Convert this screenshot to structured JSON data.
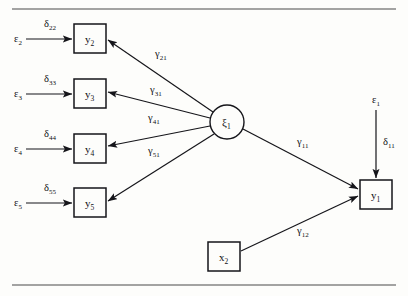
{
  "figure": {
    "type": "path-diagram",
    "rules": {
      "top_y": 9,
      "bottom_y": 285
    }
  },
  "nodes": {
    "latent": [
      {
        "id": "xi1",
        "shape": "circle",
        "symbol": "ξ",
        "subscript": "1",
        "cx": 227,
        "cy": 122,
        "r": 17
      }
    ],
    "observed": [
      {
        "id": "y2",
        "shape": "box",
        "symbol": "y",
        "subscript": "2",
        "x": 74,
        "y": 24,
        "w": 32,
        "h": 29
      },
      {
        "id": "y3",
        "shape": "box",
        "symbol": "y",
        "subscript": "3",
        "x": 74,
        "y": 79,
        "w": 32,
        "h": 29
      },
      {
        "id": "y4",
        "shape": "box",
        "symbol": "y",
        "subscript": "4",
        "x": 74,
        "y": 134,
        "w": 32,
        "h": 29
      },
      {
        "id": "y5",
        "shape": "box",
        "symbol": "y",
        "subscript": "5",
        "x": 74,
        "y": 188,
        "w": 32,
        "h": 29
      },
      {
        "id": "y1",
        "shape": "box",
        "symbol": "y",
        "subscript": "1",
        "x": 360,
        "y": 180,
        "w": 32,
        "h": 29
      },
      {
        "id": "x2",
        "shape": "box",
        "symbol": "x",
        "subscript": "2",
        "x": 208,
        "y": 242,
        "w": 32,
        "h": 29
      }
    ],
    "errors": [
      {
        "id": "e2",
        "symbol": "ε",
        "subscript": "2",
        "x": 14,
        "y": 42
      },
      {
        "id": "e3",
        "symbol": "ε",
        "subscript": "3",
        "x": 14,
        "y": 97
      },
      {
        "id": "e4",
        "symbol": "ε",
        "subscript": "4",
        "x": 14,
        "y": 152
      },
      {
        "id": "e5",
        "symbol": "ε",
        "subscript": "5",
        "x": 14,
        "y": 206
      },
      {
        "id": "e1",
        "symbol": "ε",
        "subscript": "1",
        "x": 372,
        "y": 103
      }
    ]
  },
  "edges": [
    {
      "id": "d22",
      "from": "e2",
      "to": "y2",
      "symbol": "δ",
      "subscript": "22",
      "label_x": 44,
      "label_y": 27,
      "x1": 26,
      "y1": 39,
      "x2": 72,
      "y2": 39
    },
    {
      "id": "d33",
      "from": "e3",
      "to": "y3",
      "symbol": "δ",
      "subscript": "33",
      "label_x": 44,
      "label_y": 82,
      "x1": 26,
      "y1": 94,
      "x2": 72,
      "y2": 94
    },
    {
      "id": "d44",
      "from": "e4",
      "to": "y4",
      "symbol": "δ",
      "subscript": "44",
      "label_x": 44,
      "label_y": 137,
      "x1": 26,
      "y1": 149,
      "x2": 72,
      "y2": 149
    },
    {
      "id": "d55",
      "from": "e5",
      "to": "y5",
      "symbol": "δ",
      "subscript": "55",
      "label_x": 44,
      "label_y": 191,
      "x1": 26,
      "y1": 203,
      "x2": 72,
      "y2": 203
    },
    {
      "id": "d11",
      "from": "e1",
      "to": "y1",
      "symbol": "δ",
      "subscript": "11",
      "label_x": 383,
      "label_y": 145,
      "x1": 376,
      "y1": 110,
      "x2": 376,
      "y2": 178
    },
    {
      "id": "g21",
      "from": "xi1",
      "to": "y2",
      "symbol": "γ",
      "subscript": "21",
      "label_x": 155,
      "label_y": 57,
      "x1": 213,
      "y1": 112,
      "x2": 108,
      "y2": 40
    },
    {
      "id": "g31",
      "from": "xi1",
      "to": "y3",
      "symbol": "γ",
      "subscript": "31",
      "label_x": 150,
      "label_y": 93,
      "x1": 210,
      "y1": 118,
      "x2": 108,
      "y2": 92
    },
    {
      "id": "g41",
      "from": "xi1",
      "to": "y4",
      "symbol": "γ",
      "subscript": "41",
      "label_x": 148,
      "label_y": 121,
      "x1": 210,
      "y1": 126,
      "x2": 108,
      "y2": 146
    },
    {
      "id": "g51",
      "from": "xi1",
      "to": "y5",
      "symbol": "γ",
      "subscript": "51",
      "label_x": 148,
      "label_y": 154,
      "x1": 214,
      "y1": 134,
      "x2": 108,
      "y2": 201
    },
    {
      "id": "g11",
      "from": "xi1",
      "to": "y1",
      "symbol": "γ",
      "subscript": "11",
      "label_x": 297,
      "label_y": 145,
      "x1": 243,
      "y1": 129,
      "x2": 358,
      "y2": 189
    },
    {
      "id": "g12",
      "from": "x2",
      "to": "y1",
      "symbol": "γ",
      "subscript": "12",
      "label_x": 297,
      "label_y": 234,
      "x1": 241,
      "y1": 251,
      "x2": 358,
      "y2": 196
    }
  ]
}
